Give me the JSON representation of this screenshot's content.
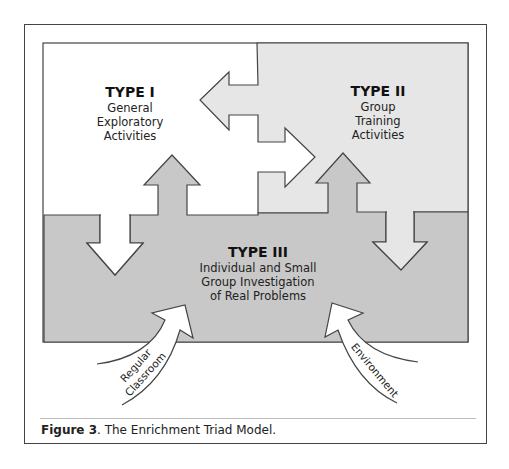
{
  "figure": {
    "caption_label": "Figure 3",
    "caption_text": ". The Enrichment Triad Model."
  },
  "regions": {
    "type1": {
      "title": "TYPE I",
      "lines": [
        "General",
        "Exploratory",
        "Activities"
      ],
      "fill": "#ffffff"
    },
    "type2": {
      "title": "TYPE II",
      "lines": [
        "Group",
        "Training",
        "Activities"
      ],
      "fill": "#e6e6e6"
    },
    "type3": {
      "title": "TYPE III",
      "lines": [
        "Individual and Small",
        "Group Investigation",
        "of Real Problems"
      ],
      "fill": "#c8c8c8"
    }
  },
  "inputs": {
    "left": {
      "lines": [
        "Regular",
        "Classroom"
      ]
    },
    "right": {
      "label": "Environment"
    }
  },
  "colors": {
    "outline": "#444444",
    "light_gray": "#e6e6e6",
    "mid_gray": "#c8c8c8"
  }
}
